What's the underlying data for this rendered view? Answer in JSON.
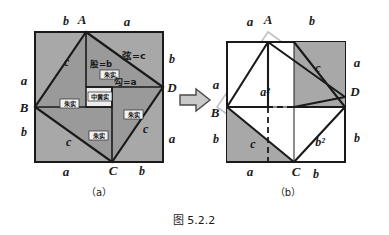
{
  "figure": {
    "caption": "图 5.2.2",
    "panels": [
      {
        "id": "a",
        "tag": "（a）",
        "outer_labels": {
          "top_left": "b",
          "top_right": "a",
          "right_top": "b",
          "right_bottom": "a",
          "bottom_left": "a",
          "bottom_right": "b",
          "left_top": "a",
          "left_bottom": "b"
        },
        "vertices": {
          "A": "A",
          "B": "B",
          "C": "C",
          "D": "D"
        },
        "side_labels": {
          "upper_left": "c",
          "lower_left": "c",
          "lower_right": "c"
        },
        "annotations": {
          "gu": "股=b",
          "xian": "弦=c",
          "gou": "勾=a"
        },
        "region_labels": {
          "zhu_shi_1": "朱实",
          "zhu_shi_2": "朱实",
          "zhu_shi_3": "朱实",
          "zhu_shi_4": "朱实",
          "zhong_huang_shi": "中黄实"
        }
      },
      {
        "id": "b",
        "tag": "（b）",
        "outer_labels": {
          "top_left": "a",
          "top_right": "b",
          "right_top": "a",
          "right_bottom": "b",
          "bottom_left": "a",
          "bottom_right": "b",
          "left_top": "a",
          "left_bottom": "b"
        },
        "vertices": {
          "A": "A",
          "B": "B",
          "C": "C",
          "D": "D"
        },
        "side_labels": {
          "upper_right": "c",
          "lower_left": "c"
        },
        "area_labels": {
          "a_squared": "a²",
          "b_squared": "b²"
        }
      }
    ],
    "arrow": "right-arrow"
  },
  "colors": {
    "fill_gray": "#a8a8a8",
    "fill_light": "#e6e6e6",
    "fill_white": "#ffffff",
    "stroke_dark": "#1a1a1a",
    "stroke_light": "#bdbdbd",
    "text": "#1a1a1a"
  }
}
